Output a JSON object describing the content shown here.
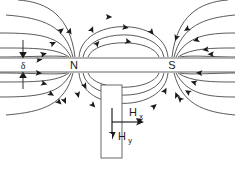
{
  "figure": {
    "type": "physics-field-diagram",
    "width": 235,
    "height": 169,
    "background_color": "#ffffff",
    "labels": {
      "north_pole": "N",
      "south_pole": "S",
      "gap_thickness": "δ",
      "field_x_main": "H",
      "field_x_sub": "x",
      "field_y_main": "H",
      "field_y_sub": "y"
    },
    "colors": {
      "field_line": "#3d3d3d",
      "medium_line": "#9a9a9a",
      "text": "#1a1a1a",
      "head_outline": "#5a5a5a"
    },
    "geometry": {
      "medium_top_y": 58,
      "medium_bottom_y": 72,
      "north_pole_x": 74,
      "south_pole_x": 172,
      "head_rect": {
        "x": 101,
        "y": 85,
        "width": 21,
        "height": 73
      }
    },
    "elements": [
      {
        "name": "medium-top-surface",
        "kind": "line"
      },
      {
        "name": "medium-bottom-surface",
        "kind": "line"
      },
      {
        "name": "gap-dimension-arrow",
        "kind": "double-arrow"
      },
      {
        "name": "north-pole-label",
        "kind": "text"
      },
      {
        "name": "south-pole-label",
        "kind": "text"
      },
      {
        "name": "field-lines-upper-inner",
        "kind": "arcs",
        "count": 3
      },
      {
        "name": "field-lines-lower-inner",
        "kind": "arcs",
        "count": 3
      },
      {
        "name": "field-lines-left-outer",
        "kind": "arcs",
        "count": 4
      },
      {
        "name": "field-lines-right-outer",
        "kind": "arcs",
        "count": 4
      },
      {
        "name": "field-lines-left-lower",
        "kind": "arcs",
        "count": 4
      },
      {
        "name": "field-lines-right-lower",
        "kind": "arcs",
        "count": 4
      },
      {
        "name": "read-head-rectangle",
        "kind": "rect"
      },
      {
        "name": "hx-vector-arrow",
        "kind": "arrow",
        "direction": "right"
      },
      {
        "name": "hy-vector-arrow",
        "kind": "arrow",
        "direction": "down"
      }
    ]
  }
}
